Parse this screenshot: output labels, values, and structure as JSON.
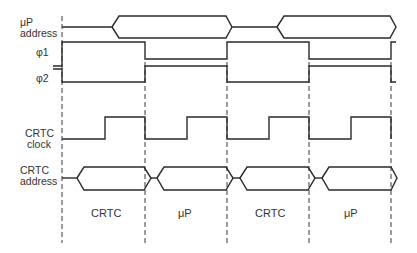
{
  "diagram": {
    "type": "timing-diagram",
    "colors": {
      "line": "#2a2a2a",
      "text": "#333333",
      "background": "#ffffff"
    },
    "signals": [
      {
        "id": "up_address",
        "label_line1": "μP",
        "label_line2": "address",
        "kind": "bus"
      },
      {
        "id": "phi1",
        "label_line1": "φ1",
        "kind": "clock"
      },
      {
        "id": "phi2",
        "label_line1": "φ2",
        "kind": "clock"
      },
      {
        "id": "crtc_clock",
        "label_line1": "CRTC",
        "label_line2": "clock",
        "kind": "clock"
      },
      {
        "id": "crtc_address",
        "label_line1": "CRTC",
        "label_line2": "address",
        "kind": "bus"
      }
    ],
    "segments": [
      {
        "label": "CRTC"
      },
      {
        "label": "μP"
      },
      {
        "label": "CRTC"
      },
      {
        "label": "μP"
      }
    ]
  }
}
